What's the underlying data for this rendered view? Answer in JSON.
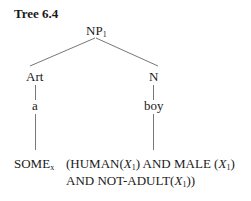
{
  "title": "Tree 6.4",
  "nodes": {
    "root": {
      "label": "NP",
      "sub": "1"
    },
    "art": {
      "label": "Art"
    },
    "n": {
      "label": "N"
    },
    "a": {
      "label": "a"
    },
    "boy": {
      "label": "boy"
    },
    "some": {
      "label": "SOME",
      "sub": "x"
    },
    "semantics_line1_a": "(HUMAN(",
    "semantics_line1_b": ") AND MALE (",
    "semantics_line1_c": ")",
    "semantics_line2_a": "AND NOT-ADULT(",
    "semantics_line2_b": "))",
    "var": "X",
    "var_sub": "1"
  }
}
